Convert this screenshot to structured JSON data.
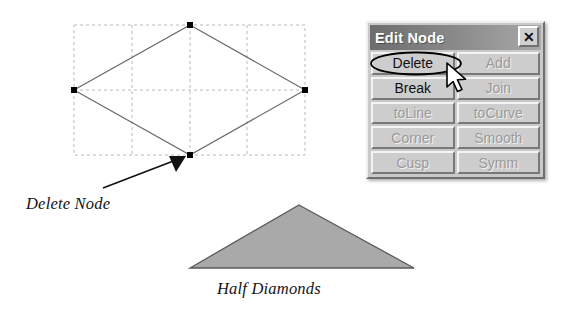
{
  "figure": {
    "diagram_label": "Delete Node",
    "shape_label": "Half Diamonds",
    "colors": {
      "grid_dash": "#b9b9c2",
      "outline": "#6b6b6b",
      "node_handle": "#000000",
      "arrow": "#111111",
      "triangle_fill": "#a9a9a9",
      "triangle_stroke": "#5a5a5a"
    },
    "diamond": {
      "nodes": [
        {
          "name": "top-node",
          "x": 190,
          "y": 25
        },
        {
          "name": "left-node",
          "x": 74,
          "y": 90
        },
        {
          "name": "right-node",
          "x": 305,
          "y": 90
        },
        {
          "name": "bottom-node",
          "x": 190,
          "y": 155
        }
      ]
    },
    "triangle": {
      "apex": {
        "x": 299,
        "y": 205
      },
      "base_left": {
        "x": 190,
        "y": 268
      },
      "base_right": {
        "x": 414,
        "y": 268
      }
    }
  },
  "dialog": {
    "title": "Edit Node",
    "close_label": "✕",
    "buttons": [
      {
        "label": "Delete",
        "enabled": true,
        "name": "delete-button"
      },
      {
        "label": "Add",
        "enabled": false,
        "name": "add-button"
      },
      {
        "label": "Break",
        "enabled": true,
        "name": "break-button"
      },
      {
        "label": "Join",
        "enabled": false,
        "name": "join-button"
      },
      {
        "label": "toLine",
        "enabled": false,
        "name": "to-line-button"
      },
      {
        "label": "toCurve",
        "enabled": false,
        "name": "to-curve-button"
      },
      {
        "label": "Corner",
        "enabled": false,
        "name": "corner-button"
      },
      {
        "label": "Smooth",
        "enabled": false,
        "name": "smooth-button"
      },
      {
        "label": "Cusp",
        "enabled": false,
        "name": "cusp-button"
      },
      {
        "label": "Symm",
        "enabled": false,
        "name": "symm-button"
      }
    ],
    "colors": {
      "face": "#c9c9c9",
      "titlebar_start": "#6d6d6d",
      "titlebar_end": "#a8a8a8",
      "title_text": "#ffffff",
      "disabled_text": "#9a9a9a"
    }
  }
}
